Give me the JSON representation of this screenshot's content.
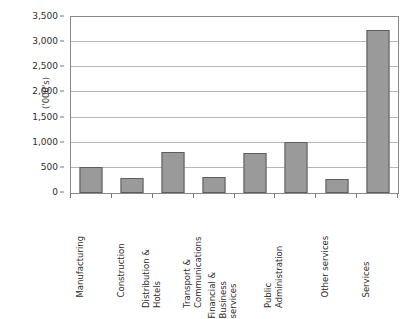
{
  "chart_data": {
    "type": "bar",
    "title": "",
    "subtitle": "",
    "xlabel": "",
    "ylabel": "('000's)",
    "ylim": [
      0,
      3500
    ],
    "ytick_values": [
      0,
      500,
      1000,
      1500,
      2000,
      2500,
      3000,
      3500
    ],
    "ytick_labels": [
      "0",
      "500",
      "1,000",
      "1,500",
      "2,000",
      "2,500",
      "3,000",
      "3,500"
    ],
    "grid": true,
    "legend": false,
    "legend_position": "none",
    "bar_fill_color": "#9a9a9a",
    "bar_border_color": "#5d5d5d",
    "gridline_color": "#b6b6b6",
    "axis_color": "#8a8a8a",
    "categories": [
      "Manufacturing",
      "Construction",
      "Distribution & Hotels",
      "Transport & Communications",
      "Financial & Business services",
      "Public Administration",
      "Other services",
      "Services"
    ],
    "category_label_lines": [
      [
        "Manufacturing"
      ],
      [
        "Construction"
      ],
      [
        "Distribution &",
        "Hotels"
      ],
      [
        "Transport &",
        "Communications"
      ],
      [
        "Financial &",
        "Business",
        "services"
      ],
      [
        "Public",
        "Administration"
      ],
      [
        "Other services"
      ],
      [
        "Services"
      ]
    ],
    "values": [
      520,
      300,
      820,
      310,
      800,
      1020,
      280,
      3240
    ]
  }
}
